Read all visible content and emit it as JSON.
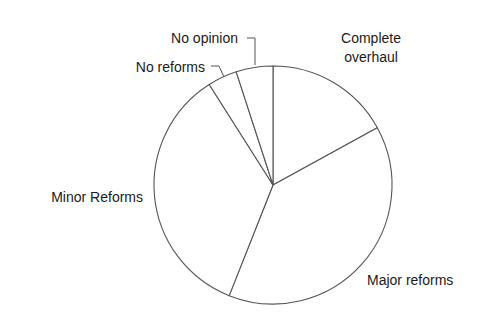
{
  "chart_data": {
    "type": "pie",
    "title": "",
    "categories": [
      "Complete overhaul",
      "Major reforms",
      "Minor Reforms",
      "No reforms",
      "No opinion"
    ],
    "values": [
      17,
      39,
      35,
      4,
      5
    ],
    "units": "percent (estimated from slice angles)",
    "start_angle_deg": 0,
    "direction": "clockwise",
    "legend": "none (direct labels)",
    "fill_color": "#ffffff",
    "stroke_color": "#555555",
    "labels": [
      {
        "text": [
          "Complete",
          "overhaul"
        ],
        "x": 371,
        "y": 43,
        "anchor": "middle",
        "leader": false
      },
      {
        "text": [
          "Major reforms"
        ],
        "x": 367,
        "y": 285,
        "anchor": "start",
        "leader": false
      },
      {
        "text": [
          "Minor Reforms"
        ],
        "x": 143,
        "y": 202,
        "anchor": "end",
        "leader": false
      },
      {
        "text": [
          "No reforms"
        ],
        "x": 205,
        "y": 72,
        "anchor": "end",
        "leader": true,
        "leader_points": [
          [
            211,
            66
          ],
          [
            219,
            66
          ],
          [
            224,
            77
          ]
        ]
      },
      {
        "text": [
          "No opinion"
        ],
        "x": 238,
        "y": 43,
        "anchor": "end",
        "leader": true,
        "leader_points": [
          [
            247,
            38
          ],
          [
            255,
            38
          ],
          [
            255,
            65
          ]
        ]
      }
    ]
  },
  "geometry": {
    "cx": 273,
    "cy": 185,
    "r": 119
  }
}
